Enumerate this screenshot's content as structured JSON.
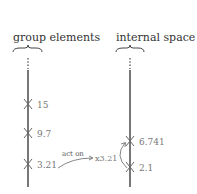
{
  "left_axis": {
    "title": "group elements",
    "marks": [
      {
        "label": "15",
        "y": 104
      },
      {
        "label": "9.7",
        "y": 133
      },
      {
        "label": "3.21",
        "y": 164
      }
    ]
  },
  "right_axis": {
    "title": "internal space",
    "marks": [
      {
        "label": "6.741",
        "y": 141
      },
      {
        "label": "2.1",
        "y": 167
      }
    ]
  },
  "action": {
    "label": "act on",
    "operator": "x3.21"
  },
  "colors": {
    "line": "#555555",
    "text": "#777777",
    "title": "#333333"
  }
}
